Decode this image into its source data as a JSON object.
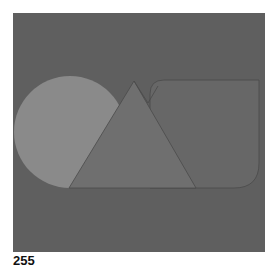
{
  "figure": {
    "label": "255",
    "colors": {
      "background": "#5f5f5f",
      "circle": "#8a8a8a",
      "triangle": "#6f6f6f",
      "rounded_rect": "#676767",
      "outline": "#4a4a4a"
    },
    "shapes": [
      "circle",
      "triangle",
      "rounded-rectangle"
    ]
  }
}
